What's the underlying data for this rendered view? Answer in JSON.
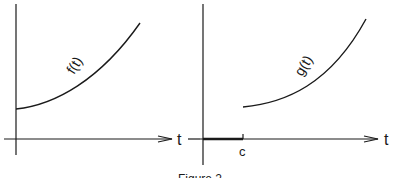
{
  "figure": {
    "caption": "Figure 2",
    "left_panel": {
      "curve_label": "f(t)",
      "x_axis_label": "t"
    },
    "right_panel": {
      "curve_label": "g(t)",
      "x_axis_label": "t",
      "tick_label": "c"
    },
    "colors": {
      "stroke": "#1a1a1a",
      "background": "#ffffff"
    }
  }
}
